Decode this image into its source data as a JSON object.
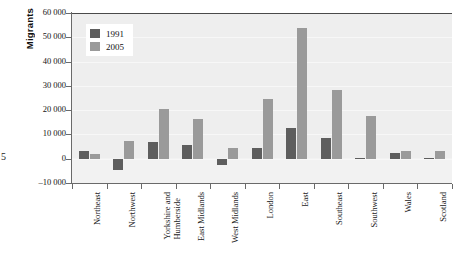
{
  "artifact": {
    "folio_digit": "5"
  },
  "chart_data": {
    "type": "bar",
    "title": "",
    "ylabel": "Migrants",
    "xlabel": "",
    "ylim": [
      -10000,
      60000
    ],
    "ytick_values": [
      60000,
      50000,
      40000,
      30000,
      20000,
      10000,
      0,
      -10000
    ],
    "ytick_labels": [
      "60 000",
      "50 000",
      "40 000",
      "30 000",
      "20 000",
      "10 000",
      "0",
      "–10 000"
    ],
    "grid": true,
    "legend_position": "upper-left-inside",
    "categories": [
      "Northeast",
      "Northwest",
      "Yorkshire and Humberside",
      "East Midlands",
      "West Midlands",
      "London",
      "East",
      "Southeast",
      "Southwest",
      "Wales",
      "Scotland"
    ],
    "category_lines": [
      [
        "Northeast"
      ],
      [
        "Northwest"
      ],
      [
        "Yorkshire and",
        "Humberside"
      ],
      [
        "East Midlands"
      ],
      [
        "West Midlands"
      ],
      [
        "London"
      ],
      [
        "East"
      ],
      [
        "Southeast"
      ],
      [
        "Southwest"
      ],
      [
        "Wales"
      ],
      [
        "Scotland"
      ]
    ],
    "series": [
      {
        "name": "1991",
        "color": "#5e5e5e",
        "values": [
          3000,
          -4500,
          6800,
          5500,
          -2500,
          4500,
          12500,
          8500,
          500,
          2200,
          400
        ]
      },
      {
        "name": "2005",
        "color": "#9a9a9a",
        "values": [
          1800,
          7500,
          20500,
          16500,
          4500,
          24500,
          54000,
          28500,
          17500,
          3200,
          3200
        ]
      }
    ]
  }
}
